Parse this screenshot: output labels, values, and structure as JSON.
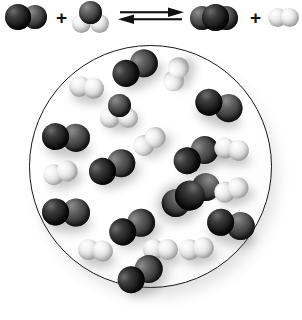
{
  "figure": {
    "kind": "chemical-equilibrium-diagram",
    "colors": {
      "dark_atom": "#151515",
      "mid_atom": "#3a3a3a",
      "light_atom": "#f0f0f0",
      "vessel_outline": "#1a1a1a",
      "background": "#ffffff"
    }
  },
  "equation": {
    "arrow_symbol": "equilibrium-double-arrow",
    "plus_left": "+",
    "plus_right": "+",
    "reactants": [
      {
        "name": "carbon-monoxide",
        "formula": "CO",
        "shape": "diatomic",
        "atoms": [
          {
            "element": "C",
            "shade": "dark",
            "cx": 14,
            "cy": 16,
            "r": 13
          },
          {
            "element": "O",
            "shade": "mid",
            "cx": 31,
            "cy": 16,
            "r": 12
          }
        ]
      },
      {
        "name": "water",
        "formula": "H2O",
        "shape": "bent-triatomic",
        "atoms": [
          {
            "element": "O",
            "shade": "mid",
            "cx": 17,
            "cy": 12,
            "r": 11
          },
          {
            "element": "H",
            "shade": "light",
            "cx": 8,
            "cy": 24,
            "r": 9
          },
          {
            "element": "H",
            "shade": "light",
            "cx": 27,
            "cy": 24,
            "r": 9
          }
        ]
      }
    ],
    "products": [
      {
        "name": "carbon-dioxide",
        "formula": "CO2",
        "shape": "linear-triatomic",
        "atoms": [
          {
            "element": "O",
            "shade": "mid",
            "cx": 13,
            "cy": 16,
            "r": 12
          },
          {
            "element": "C",
            "shade": "dark",
            "cx": 25,
            "cy": 16,
            "r": 13
          },
          {
            "element": "O",
            "shade": "mid",
            "cx": 37,
            "cy": 16,
            "r": 12
          }
        ]
      },
      {
        "name": "hydrogen",
        "formula": "H2",
        "shape": "diatomic",
        "atoms": [
          {
            "element": "H",
            "shade": "light",
            "cx": 10,
            "cy": 17,
            "r": 9
          },
          {
            "element": "H",
            "shade": "light",
            "cx": 21,
            "cy": 17,
            "r": 9
          }
        ]
      }
    ]
  },
  "vessel": {
    "name": "reaction-vessel",
    "shape": "circle",
    "center_x": 150,
    "center_y": 166,
    "radius": 121,
    "molecules": [
      {
        "id": "mol-co-1",
        "formula": "CO",
        "type": "diatomic-dark",
        "x": 135,
        "y": 68,
        "angle": -28
      },
      {
        "id": "mol-h2-1",
        "formula": "H2",
        "type": "diatomic-light",
        "x": 88,
        "y": 88,
        "angle": 8
      },
      {
        "id": "mol-h2o-1",
        "formula": "H2O",
        "type": "bent-water",
        "x": 120,
        "y": 112,
        "angle": 0
      },
      {
        "id": "mol-h2-2",
        "formula": "H2",
        "type": "diatomic-light",
        "x": 177,
        "y": 73,
        "angle": -70
      },
      {
        "id": "mol-co-2",
        "formula": "CO",
        "type": "diatomic-dark",
        "x": 219,
        "y": 105,
        "angle": 18
      },
      {
        "id": "mol-co-3",
        "formula": "CO",
        "type": "diatomic-dark",
        "x": 66,
        "y": 137,
        "angle": 5
      },
      {
        "id": "mol-h2-3",
        "formula": "H2",
        "type": "diatomic-light",
        "x": 151,
        "y": 141,
        "angle": -35
      },
      {
        "id": "mol-co-4",
        "formula": "CO",
        "type": "diatomic-dark",
        "x": 112,
        "y": 167,
        "angle": -22
      },
      {
        "id": "mol-co-5",
        "formula": "CO",
        "type": "diatomic-dark",
        "x": 196,
        "y": 155,
        "angle": -30
      },
      {
        "id": "mol-h2-4",
        "formula": "H2",
        "type": "diatomic-light",
        "x": 62,
        "y": 173,
        "angle": -15
      },
      {
        "id": "mol-h2-5",
        "formula": "H2",
        "type": "diatomic-light",
        "x": 233,
        "y": 150,
        "angle": 10
      },
      {
        "id": "mol-co2-1",
        "formula": "CO2",
        "type": "linear-dark",
        "x": 189,
        "y": 196,
        "angle": 62
      },
      {
        "id": "mol-co-6",
        "formula": "CO",
        "type": "diatomic-dark",
        "x": 66,
        "y": 212,
        "angle": 3
      },
      {
        "id": "mol-co-7",
        "formula": "CO",
        "type": "diatomic-dark",
        "x": 132,
        "y": 227,
        "angle": -25
      },
      {
        "id": "mol-co-8",
        "formula": "CO",
        "type": "diatomic-dark",
        "x": 231,
        "y": 224,
        "angle": 12
      },
      {
        "id": "mol-h2-6",
        "formula": "H2",
        "type": "diatomic-light",
        "x": 233,
        "y": 190,
        "angle": -18
      },
      {
        "id": "mol-h2-7",
        "formula": "H2",
        "type": "diatomic-light",
        "x": 97,
        "y": 251,
        "angle": 6
      },
      {
        "id": "mol-h2-8",
        "formula": "H2",
        "type": "diatomic-light",
        "x": 162,
        "y": 250,
        "angle": 0
      },
      {
        "id": "mol-h2-9",
        "formula": "H2",
        "type": "diatomic-light",
        "x": 198,
        "y": 249,
        "angle": -8
      },
      {
        "id": "mol-co-9",
        "formula": "CO",
        "type": "diatomic-dark",
        "x": 140,
        "y": 274,
        "angle": -30
      }
    ],
    "counts": {
      "CO": 9,
      "H2": 9,
      "CO2": 1,
      "H2O": 1
    }
  }
}
